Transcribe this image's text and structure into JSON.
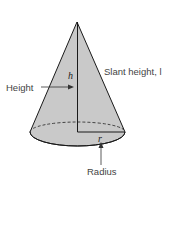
{
  "diagram": {
    "labels": {
      "height": "Height",
      "h": "h",
      "slant_height": "Slant height, l",
      "r": "r",
      "radius": "Radius"
    },
    "colors": {
      "fill": "#c9c9c9",
      "stroke": "#1a1a1a",
      "text": "#444444"
    }
  }
}
